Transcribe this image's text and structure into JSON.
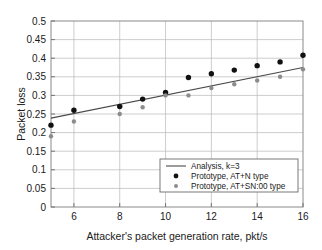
{
  "chart_data": {
    "type": "scatter",
    "title": "",
    "xlabel": "Attacker's packet generation rate, pkt/s",
    "ylabel": "Packet loss",
    "xlim": [
      5,
      16
    ],
    "ylim": [
      0,
      0.5
    ],
    "xticks": [
      6,
      8,
      10,
      12,
      14,
      16
    ],
    "xtick_labels": [
      "6",
      "8",
      "10",
      "12",
      "14",
      "16"
    ],
    "yticks": [
      0,
      0.05,
      0.1,
      0.15,
      0.2,
      0.25,
      0.3,
      0.35,
      0.4,
      0.45,
      0.5
    ],
    "ytick_labels": [
      "0",
      "0.05",
      "0.1",
      "0.15",
      "0.2",
      "0.25",
      "0.3",
      "0.35",
      "0.4",
      "0.45",
      "0.5"
    ],
    "grid": true,
    "legend_position": "lower-right",
    "series": [
      {
        "name": "Analysis, k=3",
        "kind": "line",
        "color": "#4a4a4a",
        "x": [
          5,
          16
        ],
        "values": [
          0.239,
          0.375
        ]
      },
      {
        "name": "Prototype, AT+N type",
        "kind": "markers",
        "color": "#111111",
        "x": [
          5,
          6,
          8,
          9,
          10,
          11,
          12,
          13,
          14,
          15,
          16
        ],
        "values": [
          0.22,
          0.26,
          0.27,
          0.29,
          0.308,
          0.348,
          0.358,
          0.368,
          0.38,
          0.39,
          0.408
        ]
      },
      {
        "name": "Prototype, AT+SN:00 type",
        "kind": "markers",
        "color": "#8c8c8c",
        "x": [
          5,
          6,
          8,
          9,
          10,
          11,
          12,
          13,
          14,
          15,
          16
        ],
        "values": [
          0.19,
          0.23,
          0.25,
          0.268,
          0.3,
          0.3,
          0.32,
          0.33,
          0.34,
          0.35,
          0.37
        ]
      }
    ]
  },
  "legend": {
    "entries": [
      {
        "label": "Analysis, k=3",
        "marker": "line"
      },
      {
        "label": "Prototype, AT+N type",
        "marker": "dot-dark"
      },
      {
        "label": "Prototype, AT+SN:00 type",
        "marker": "dot-gray"
      }
    ]
  },
  "colors": {
    "series_dark": "#111111",
    "series_gray": "#8c8c8c",
    "line": "#4a4a4a",
    "grid": "#b8b8b8",
    "frame": "#8a8a8a",
    "text": "#1a1a1a",
    "background": "#ffffff"
  }
}
